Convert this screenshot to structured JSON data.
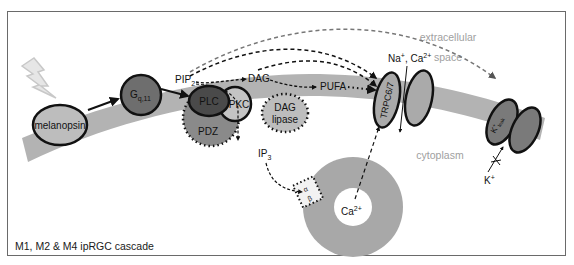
{
  "title": "M1, M2 & M4 ipRGC cascade",
  "regions": {
    "extracellular": [
      "extracellular",
      "space"
    ],
    "cytoplasm": "cytoplasm"
  },
  "nodes": {
    "light": "light",
    "melanopsin": "melanopsin",
    "gq11": {
      "main": "G",
      "sub": "q,11"
    },
    "pip2": {
      "main": "PIP",
      "sub": "2"
    },
    "plc": "PLC",
    "pkc": "PKC",
    "pdz": "PDZ",
    "dag": "DAG",
    "dag_lipase": [
      "DAG",
      "lipase"
    ],
    "pufa": "PUFA",
    "ip3": {
      "main": "IP",
      "sub": "3"
    },
    "trpc": "TRPC6/7",
    "na_ca": {
      "na": "Na",
      "na_sup": "+",
      "sep": ", Ca",
      "ca_sup": "2+"
    },
    "kleak": {
      "main": "K",
      "sup": "+",
      "sub": "leak"
    },
    "k_ion": {
      "main": "K",
      "sup": "+"
    },
    "er_ca": {
      "main": "Ca",
      "sup": "2+"
    },
    "ip3r": {
      "alpha": "α",
      "beta": "β"
    }
  },
  "colors": {
    "membrane": "#b3b3b3",
    "melanopsin": "#bdbdbd",
    "gprotein": "#6e6e6e",
    "plc": "#4a4a4a",
    "pdz": "#8a8a8a",
    "channel_trpc": "#aaaaaa",
    "channel_k": "#7a7a7a",
    "er": "#a8a8a8",
    "region_text": "#a0a0a0"
  }
}
